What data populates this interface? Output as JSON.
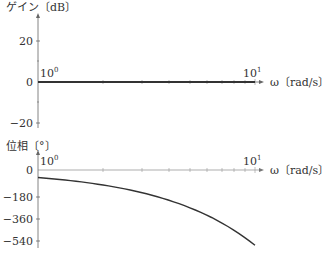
{
  "chart_data": [
    {
      "type": "line",
      "title": "",
      "ylabel": "ゲイン〔dB〕",
      "xlabel": "ω〔rad/s〕",
      "xscale": "log",
      "x_ticks": [
        "10^0",
        "10^1"
      ],
      "y_ticks": [
        20,
        0,
        -20
      ],
      "ylim": [
        -20,
        20
      ],
      "xlim": [
        1,
        10
      ],
      "grid": false,
      "series": [
        {
          "name": "gain",
          "x": [
            1,
            2,
            3,
            5,
            7,
            10
          ],
          "values": [
            0,
            0,
            0,
            0,
            0,
            0
          ]
        }
      ]
    },
    {
      "type": "line",
      "title": "",
      "ylabel": "位相〔°〕",
      "xlabel": "ω〔rad/s〕",
      "xscale": "log",
      "x_ticks": [
        "10^0",
        "10^1"
      ],
      "y_ticks": [
        0,
        -180,
        -360,
        -540
      ],
      "ylim": [
        -560,
        0
      ],
      "xlim": [
        1,
        10
      ],
      "grid": false,
      "series": [
        {
          "name": "phase",
          "x": [
            1,
            2,
            3,
            4,
            5,
            6,
            7,
            8,
            9,
            10
          ],
          "values": [
            -57,
            -115,
            -172,
            -229,
            -286,
            -344,
            -401,
            -458,
            -516,
            -573
          ]
        }
      ]
    }
  ],
  "labels": {
    "gain_axis": "ゲイン〔dB〕",
    "phase_axis": "位相〔°〕",
    "omega_axis": "ω〔rad/s〕",
    "omega_axis_phase": "ω〔rad/s〕",
    "x_tick_base": "10",
    "x_tick_exp_0": "0",
    "x_tick_exp_1": "1",
    "gain_tick_20": "20",
    "gain_tick_0": "0",
    "gain_tick_m20": "−20",
    "phase_tick_0": "0",
    "phase_tick_m180": "−180",
    "phase_tick_m360": "−360",
    "phase_tick_m540": "−540"
  },
  "colors": {
    "axis": "#555555",
    "curve": "#333333"
  }
}
